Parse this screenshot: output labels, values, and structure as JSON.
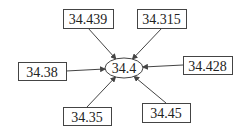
{
  "diagram": {
    "center": {
      "label": "34.4",
      "cx": 124,
      "cy": 68,
      "rx": 19,
      "ry": 10
    },
    "nodes": [
      {
        "id": "top-left",
        "label": "34.439",
        "x": 63,
        "y": 9,
        "w": 50,
        "h": 19,
        "ax": 88,
        "ay": 28
      },
      {
        "id": "top-right",
        "label": "34.315",
        "x": 137,
        "y": 9,
        "w": 49,
        "h": 19,
        "ax": 162,
        "ay": 28
      },
      {
        "id": "left",
        "label": "34.38",
        "x": 18,
        "y": 62,
        "w": 48,
        "h": 18,
        "ax": 66,
        "ay": 71
      },
      {
        "id": "right",
        "label": "34.428",
        "x": 183,
        "y": 56,
        "w": 49,
        "h": 18,
        "ax": 183,
        "ay": 65
      },
      {
        "id": "bottom-left",
        "label": "34.35",
        "x": 63,
        "y": 107,
        "w": 48,
        "h": 18,
        "ax": 87,
        "ay": 107
      },
      {
        "id": "bottom-right",
        "label": "34.45",
        "x": 142,
        "y": 103,
        "w": 48,
        "h": 19,
        "ax": 166,
        "ay": 103
      }
    ],
    "edge_direction": "into-center",
    "colors": {
      "stroke": "#444444",
      "text": "#222222"
    }
  }
}
